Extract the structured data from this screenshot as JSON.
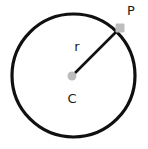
{
  "figure": {
    "background_color": "#ffffff",
    "width": 148,
    "height": 149,
    "stroke_color": "#101010",
    "marker_color": "#bdbdbd",
    "label_color": "#1a1a1a",
    "circle": {
      "center_x": 73.5,
      "center_y": 75.5,
      "radius": 61.5,
      "stroke_width": 3.2
    },
    "center_point": {
      "name": "center-point",
      "x": 72,
      "y": 76,
      "diameter": 9,
      "label": "C",
      "label_x": 72,
      "label_y": 99
    },
    "circumference_point": {
      "name": "point-p",
      "x": 120,
      "y": 28,
      "size": 9,
      "label": "P",
      "label_x": 131,
      "label_y": 11
    },
    "radius_segment": {
      "name": "radius-line",
      "x1": 72,
      "y1": 76,
      "x2": 120,
      "y2": 28,
      "stroke_width": 2.6,
      "label": "r",
      "label_x": 77,
      "label_y": 47
    }
  }
}
